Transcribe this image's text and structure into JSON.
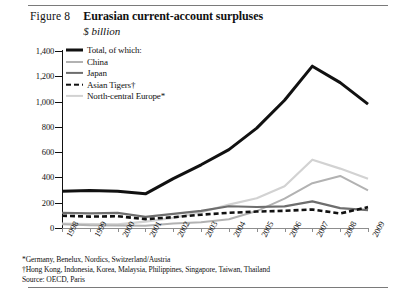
{
  "header": {
    "figure_number": "Figure 8",
    "title": "Eurasian current-account surpluses",
    "subtitle": "$ billion"
  },
  "legend": [
    {
      "label": "Total, of which:",
      "color": "#111111",
      "width": 3.0,
      "dashed": false,
      "key": "total"
    },
    {
      "label": "China",
      "color": "#b2b2b2",
      "width": 2.0,
      "dashed": false,
      "key": "china"
    },
    {
      "label": "Japan",
      "color": "#6e6e6e",
      "width": 2.2,
      "dashed": false,
      "key": "japan"
    },
    {
      "label": "Asian Tigers†",
      "color": "#111111",
      "width": 2.6,
      "dashed": true,
      "key": "asian_tigers"
    },
    {
      "label": "North-central Europe*",
      "color": "#d2d2d2",
      "width": 2.2,
      "dashed": false,
      "key": "nc_europe"
    }
  ],
  "notes": [
    "*Germany, Benelux, Nordics, Switzerland/Austria",
    "†Hong Kong, Indonesia, Korea, Malaysia, Philippines, Singapore, Taiwan, Thailand",
    "Source: OECD, Paris"
  ],
  "chart_data": {
    "type": "line",
    "title": "Eurasian current-account surpluses",
    "subtitle": "$ billion",
    "xlabel": "",
    "ylabel": "$ billion",
    "ylim": [
      0,
      1400
    ],
    "yticks": [
      0,
      200,
      400,
      600,
      800,
      1000,
      1200,
      1400
    ],
    "ytick_labels": [
      "0",
      "200",
      "400",
      "600",
      "800",
      "1,000",
      "1,200",
      "1,400"
    ],
    "grid": false,
    "legend_position": "top-left",
    "categories": [
      "1998",
      "1999",
      "2000",
      "2001",
      "2002",
      "2003",
      "2004",
      "2005",
      "2006",
      "2007",
      "2008",
      "2009"
    ],
    "series": [
      {
        "name": "Total, of which:",
        "color": "#111111",
        "width": 3.0,
        "dashed": false,
        "values": [
          290,
          296,
          291,
          270,
          390,
          500,
          620,
          790,
          1010,
          1280,
          1150,
          980
        ]
      },
      {
        "name": "China",
        "color": "#b2b2b2",
        "width": 2.0,
        "dashed": false,
        "values": [
          30,
          21,
          20,
          17,
          35,
          46,
          69,
          134,
          232,
          354,
          412,
          297
        ]
      },
      {
        "name": "Japan",
        "color": "#6e6e6e",
        "width": 2.2,
        "dashed": false,
        "values": [
          120,
          115,
          120,
          88,
          112,
          136,
          172,
          166,
          171,
          211,
          157,
          142
        ]
      },
      {
        "name": "Asian Tigers†",
        "color": "#111111",
        "width": 2.6,
        "dashed": true,
        "values": [
          97,
          90,
          93,
          70,
          85,
          105,
          120,
          130,
          136,
          146,
          115,
          165
        ]
      },
      {
        "name": "North-central Europe*",
        "color": "#d2d2d2",
        "width": 2.2,
        "dashed": false,
        "values": [
          35,
          30,
          28,
          50,
          80,
          125,
          185,
          235,
          330,
          540,
          470,
          390
        ]
      }
    ]
  }
}
